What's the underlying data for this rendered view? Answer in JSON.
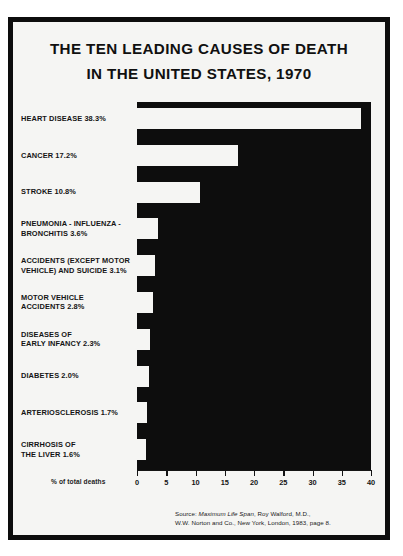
{
  "poster": {
    "title_line_1": "THE TEN LEADING CAUSES OF DEATH",
    "title_line_2": "IN THE UNITED STATES, 1970",
    "axis_title": "% of total deaths",
    "source_prefix": "Source: ",
    "source_italic": "Maximum Life Span",
    "source_rest": ", Roy Walford, M.D.,",
    "source_line_2": "W.W. Norton and Co., New York, London, 1983, page 8.",
    "colors": {
      "ink": "#0d0d0d",
      "paper": "#f5f5f3",
      "bar": "#f5f5f3",
      "plot": "#0d0d0d"
    }
  },
  "chart_data": {
    "type": "bar",
    "orientation": "horizontal",
    "title": "THE TEN LEADING CAUSES OF DEATH IN THE UNITED STATES, 1970",
    "xlabel": "% of total deaths",
    "ylabel": "",
    "xlim": [
      0,
      40
    ],
    "grid": false,
    "legend": null,
    "xticks": [
      0,
      5,
      10,
      15,
      20,
      25,
      30,
      35,
      40
    ],
    "xticklabels": [
      "0",
      "5",
      "10",
      "15",
      "20",
      "25",
      "30",
      "35",
      "40"
    ],
    "categories": [
      "HEART DISEASE",
      "CANCER",
      "STROKE",
      "PNEUMONIA - INFLUENZA - BRONCHITIS",
      "ACCIDENTS (EXCEPT MOTOR VEHICLE) AND SUICIDE",
      "MOTOR VEHICLE ACCIDENTS",
      "DISEASES OF EARLY INFANCY",
      "DIABETES",
      "ARTERIOSCLEROSIS",
      "CIRRHOSIS OF THE LIVER"
    ],
    "values": [
      38.3,
      17.2,
      10.8,
      3.6,
      3.1,
      2.8,
      2.3,
      2.0,
      1.7,
      1.6
    ],
    "labels": [
      {
        "lines": [
          "HEART DISEASE 38.3%"
        ],
        "value": 38.3
      },
      {
        "lines": [
          "CANCER 17.2%"
        ],
        "value": 17.2
      },
      {
        "lines": [
          "STROKE 10.8%"
        ],
        "value": 10.8
      },
      {
        "lines": [
          "PNEUMONIA - INFLUENZA -",
          "BRONCHITIS 3.6%"
        ],
        "value": 3.6
      },
      {
        "lines": [
          "ACCIDENTS (EXCEPT MOTOR",
          "VEHICLE) AND SUICIDE 3.1%"
        ],
        "value": 3.1
      },
      {
        "lines": [
          "MOTOR VEHICLE",
          "ACCIDENTS 2.8%"
        ],
        "value": 2.8
      },
      {
        "lines": [
          "DISEASES OF",
          "EARLY INFANCY 2.3%"
        ],
        "value": 2.3
      },
      {
        "lines": [
          "DIABETES 2.0%"
        ],
        "value": 2.0
      },
      {
        "lines": [
          "ARTERIOSCLEROSIS 1.7%"
        ],
        "value": 1.7
      },
      {
        "lines": [
          "CIRRHOSIS OF",
          "THE LIVER 1.6%"
        ],
        "value": 1.6
      }
    ]
  }
}
